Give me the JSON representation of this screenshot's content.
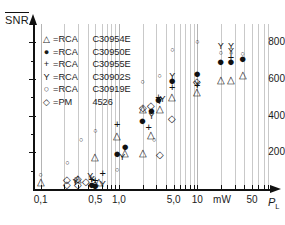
{
  "chart_data": {
    "type": "scatter",
    "title": "",
    "ylabel": "SNR",
    "ylabel_overline": true,
    "xlabel": "P",
    "xlabel_sub": "L",
    "xunit": "mW",
    "xscale": "log",
    "yscale": "linear",
    "xlim": [
      0.08,
      80
    ],
    "ylim": [
      0,
      900
    ],
    "grid": true,
    "grid_axis": "x",
    "legend_position": "upper-left",
    "ytick_labels": [
      "200",
      "400",
      "600",
      "800"
    ],
    "ytick_values": [
      200,
      400,
      600,
      800
    ],
    "xtick_labels": [
      "0,1",
      "0,5",
      "1,0",
      "5,0",
      "10",
      "mW",
      "50"
    ],
    "xtick_values": [
      0.1,
      0.5,
      1.0,
      5.0,
      10,
      null,
      50
    ],
    "series": [
      {
        "name": "RCA C30954E",
        "marker": "triangle",
        "marker_glyph": "△",
        "points": [
          {
            "x": 0.1,
            "y": 45
          },
          {
            "x": 0.3,
            "y": 60
          },
          {
            "x": 0.5,
            "y": 180
          },
          {
            "x": 0.55,
            "y": 45
          },
          {
            "x": 0.95,
            "y": 295
          },
          {
            "x": 1.2,
            "y": 200
          },
          {
            "x": 2.0,
            "y": 440
          },
          {
            "x": 2.0,
            "y": 200
          },
          {
            "x": 2.6,
            "y": 300
          },
          {
            "x": 3.3,
            "y": 440
          },
          {
            "x": 4.8,
            "y": 505
          },
          {
            "x": 10.0,
            "y": 535
          },
          {
            "x": 20.0,
            "y": 600
          },
          {
            "x": 27.0,
            "y": 600
          },
          {
            "x": 38.0,
            "y": 630
          }
        ]
      },
      {
        "name": "RCA C30950E",
        "marker": "filled-circle",
        "marker_glyph": "●",
        "points": [
          {
            "x": 0.45,
            "y": 30
          },
          {
            "x": 0.5,
            "y": 20
          },
          {
            "x": 0.95,
            "y": 195
          },
          {
            "x": 1.2,
            "y": 235
          },
          {
            "x": 2.0,
            "y": 375
          },
          {
            "x": 2.6,
            "y": 430
          },
          {
            "x": 3.2,
            "y": 490
          },
          {
            "x": 4.8,
            "y": 595
          },
          {
            "x": 10.0,
            "y": 635
          },
          {
            "x": 20.0,
            "y": 700
          },
          {
            "x": 27.0,
            "y": 700
          },
          {
            "x": 38.0,
            "y": 715
          }
        ]
      },
      {
        "name": "RCA C30955E",
        "marker": "plus",
        "marker_glyph": "+",
        "points": [
          {
            "x": 0.45,
            "y": 55
          },
          {
            "x": 0.5,
            "y": 50
          },
          {
            "x": 0.62,
            "y": 90
          },
          {
            "x": 0.95,
            "y": 355
          },
          {
            "x": 2.4,
            "y": 340
          },
          {
            "x": 3.2,
            "y": 500
          },
          {
            "x": 4.8,
            "y": 555
          },
          {
            "x": 10.0,
            "y": 570
          },
          {
            "x": 27.0,
            "y": 720
          }
        ]
      },
      {
        "name": "RCA C30902S",
        "marker": "Y",
        "marker_glyph": "Y",
        "points": [
          {
            "x": 0.28,
            "y": 40
          },
          {
            "x": 0.43,
            "y": 70
          },
          {
            "x": 0.45,
            "y": 55
          },
          {
            "x": 0.62,
            "y": 25
          },
          {
            "x": 1.1,
            "y": 175
          },
          {
            "x": 2.6,
            "y": 400
          },
          {
            "x": 3.3,
            "y": 480
          },
          {
            "x": 3.6,
            "y": 490
          },
          {
            "x": 4.8,
            "y": 615
          },
          {
            "x": 10.0,
            "y": 575
          },
          {
            "x": 20.0,
            "y": 780
          },
          {
            "x": 27.0,
            "y": 780
          },
          {
            "x": 27.0,
            "y": 755
          }
        ]
      },
      {
        "name": "RCA C30919E",
        "marker": "open-circle",
        "marker_glyph": "○",
        "points": [
          {
            "x": 0.1,
            "y": 80
          },
          {
            "x": 0.22,
            "y": 145
          },
          {
            "x": 0.28,
            "y": 60
          },
          {
            "x": 0.33,
            "y": 275
          },
          {
            "x": 0.5,
            "y": 320
          },
          {
            "x": 0.5,
            "y": 35
          },
          {
            "x": 0.95,
            "y": 110
          },
          {
            "x": 2.0,
            "y": 590
          },
          {
            "x": 2.8,
            "y": 275
          },
          {
            "x": 3.3,
            "y": 620
          },
          {
            "x": 4.8,
            "y": 765
          },
          {
            "x": 10.0,
            "y": 810
          },
          {
            "x": 20.0,
            "y": 745
          },
          {
            "x": 27.0,
            "y": 745
          },
          {
            "x": 38.0,
            "y": 740
          }
        ]
      },
      {
        "name": "PM 4526",
        "marker": "diamond",
        "marker_glyph": "◇",
        "points": [
          {
            "x": 0.22,
            "y": 55
          },
          {
            "x": 0.22,
            "y": 25
          },
          {
            "x": 0.3,
            "y": 60
          },
          {
            "x": 0.3,
            "y": 25
          },
          {
            "x": 0.38,
            "y": 45
          },
          {
            "x": 0.5,
            "y": 30
          },
          {
            "x": 2.0,
            "y": 445
          },
          {
            "x": 2.6,
            "y": 460
          },
          {
            "x": 3.3,
            "y": 190
          },
          {
            "x": 4.8,
            "y": 385
          },
          {
            "x": 10.0,
            "y": 590
          }
        ]
      }
    ]
  },
  "legend": {
    "rows": [
      {
        "marker": "△",
        "eq": "=",
        "maker": "RCA",
        "model": "C30954E"
      },
      {
        "marker": "●",
        "eq": "=",
        "maker": "RCA",
        "model": "C30950E"
      },
      {
        "marker": "+",
        "eq": "=",
        "maker": "RCA",
        "model": "C30955E"
      },
      {
        "marker": "Y",
        "eq": "=",
        "maker": "RCA",
        "model": "C30902S"
      },
      {
        "marker": "○",
        "eq": "=",
        "maker": "RCA",
        "model": "C30919E"
      },
      {
        "marker": "◇",
        "eq": "=",
        "maker": "PM",
        "model": "4526"
      }
    ]
  },
  "axes": {
    "y_title": "SNR",
    "x_title": "P",
    "x_title_sub": "L",
    "y_ticks": [
      "200",
      "400",
      "600",
      "800"
    ],
    "x_ticks": [
      "0,1",
      "0,5",
      "1,0",
      "5,0",
      "10",
      "mW",
      "50"
    ]
  },
  "colors": {
    "ink": "#1a1a1a",
    "grid": "#c9c9c9",
    "background": "#ffffff"
  }
}
